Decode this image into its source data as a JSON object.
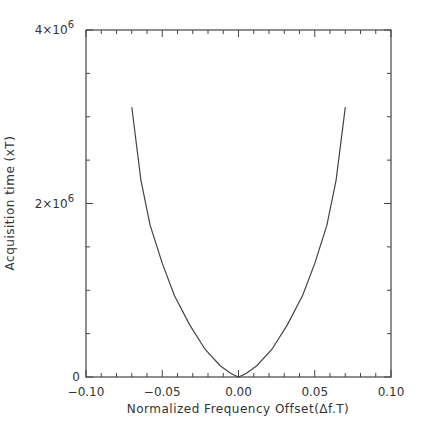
{
  "chart_data": {
    "type": "line",
    "title": "",
    "xlabel": "Normalized Frequency Offset(Δf.T)",
    "ylabel": "Acquisition time (xT)",
    "xlim": [
      -0.1,
      0.1
    ],
    "ylim": [
      0,
      4000000
    ],
    "x_ticks": [
      -0.1,
      -0.05,
      0.0,
      0.05,
      0.1
    ],
    "x_tick_labels": [
      "−0.10",
      "−0.05",
      "0.00",
      "0.05",
      "0.10"
    ],
    "y_ticks": [
      0,
      2000000,
      4000000
    ],
    "y_tick_labels": [
      {
        "base": "0",
        "exp": ""
      },
      {
        "base": "2×10",
        "exp": "6"
      },
      {
        "base": "4×10",
        "exp": "6"
      }
    ],
    "grid": false,
    "legend": null,
    "series": [
      {
        "name": "Acquisition time",
        "color": "#444444",
        "x": [
          -0.07,
          -0.064,
          -0.058,
          -0.05,
          -0.042,
          -0.032,
          -0.022,
          -0.012,
          -0.005,
          0.0,
          0.005,
          0.012,
          0.022,
          0.032,
          0.042,
          0.05,
          0.058,
          0.064,
          0.07
        ],
        "y": [
          3110000,
          2270000,
          1750000,
          1310000,
          940000,
          600000,
          320000,
          130000,
          40000,
          0,
          40000,
          130000,
          320000,
          600000,
          940000,
          1310000,
          1750000,
          2270000,
          3110000
        ]
      }
    ]
  }
}
